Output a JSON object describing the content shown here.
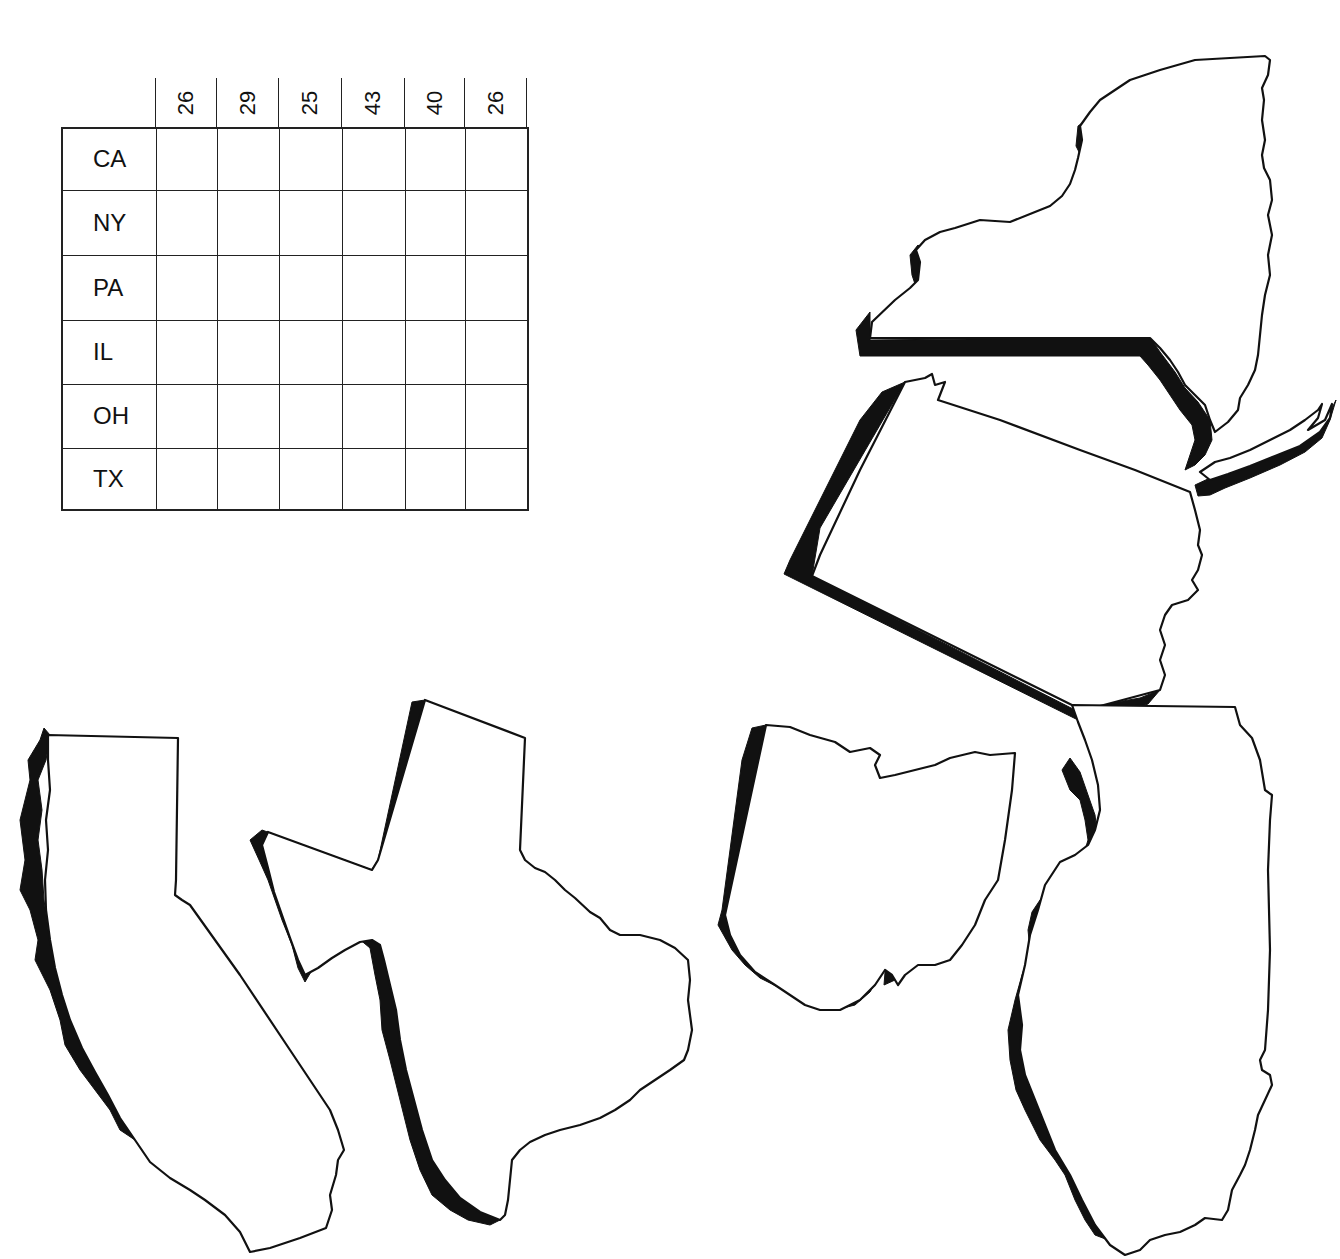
{
  "worksheet": {
    "grid": {
      "column_headers": [
        "26",
        "29",
        "25",
        "43",
        "40",
        "26"
      ],
      "row_labels": [
        "CA",
        "NY",
        "PA",
        "IL",
        "OH",
        "TX"
      ],
      "cells_filled": false
    },
    "state_cutouts": [
      {
        "id": "NY",
        "name": "New York"
      },
      {
        "id": "PA",
        "name": "Pennsylvania"
      },
      {
        "id": "CA",
        "name": "California"
      },
      {
        "id": "TX",
        "name": "Texas"
      },
      {
        "id": "OH",
        "name": "Ohio"
      },
      {
        "id": "IL",
        "name": "Illinois"
      }
    ],
    "colors": {
      "ink": "#111111",
      "paper": "#ffffff"
    }
  }
}
